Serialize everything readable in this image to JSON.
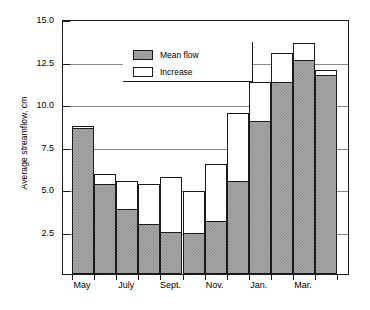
{
  "chart_data": {
    "type": "bar",
    "title": "",
    "xlabel": "",
    "ylabel": "Average streamflow, cm",
    "ylim": [
      0,
      15.0
    ],
    "yticks": [
      2.5,
      5.0,
      7.5,
      10.0,
      12.5,
      15.0
    ],
    "ytick_labels": [
      "2.5",
      "5.0",
      "7.5",
      "10.0",
      "12.5",
      "15.0"
    ],
    "grid": "horizontal",
    "stacked": true,
    "legend_position": "top-left",
    "legend": [
      {
        "label": "Mean flow",
        "swatch": "hatched-grey"
      },
      {
        "label": "Increase",
        "swatch": "white"
      }
    ],
    "categories": [
      "May",
      "June",
      "July",
      "Aug.",
      "Sept.",
      "Oct.",
      "Nov.",
      "Dec.",
      "Jan.",
      "Feb.",
      "Mar.",
      "Apr."
    ],
    "xtick_labels": [
      "May",
      "July",
      "Sept.",
      "Nov.",
      "Jan.",
      "Mar."
    ],
    "xtick_label_indices": [
      0,
      2,
      4,
      6,
      8,
      10
    ],
    "series": [
      {
        "name": "Mean flow",
        "values": [
          8.6,
          5.3,
          3.8,
          2.95,
          2.5,
          2.4,
          3.1,
          5.5,
          9.0,
          11.3,
          12.6,
          11.7
        ]
      },
      {
        "name": "Increase",
        "values": [
          0.1,
          0.6,
          1.7,
          2.35,
          3.2,
          2.5,
          3.4,
          4.0,
          2.3,
          1.7,
          1.0,
          0.3
        ]
      }
    ],
    "totals": [
      8.7,
      5.9,
      5.5,
      5.3,
      5.7,
      4.9,
      6.5,
      9.5,
      11.3,
      13.0,
      13.6,
      12.0
    ],
    "colors": {
      "mean_flow": "#a8a8a8",
      "increase": "#ffffff",
      "axis": "#1a1a1a",
      "gridline": "#8a8a8a"
    }
  }
}
